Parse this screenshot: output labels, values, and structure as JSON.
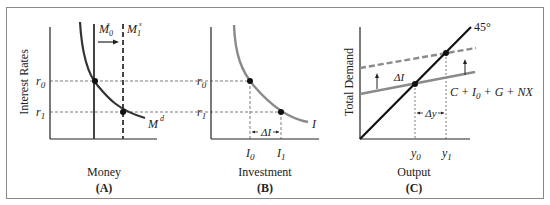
{
  "panels": {
    "a": {
      "ylabel": "Interest Rates",
      "xlabel": "Money",
      "tag": "(A)",
      "ticks": {
        "r0": "r",
        "r0_sub": "0",
        "r1": "r",
        "r1_sub": "1"
      },
      "curves": {
        "ms0": "M",
        "ms0_sub": "0",
        "ms0_sup": "s",
        "ms1": "M",
        "ms1_sub": "1",
        "ms1_sup": "s",
        "md": "M",
        "md_sup": "d"
      }
    },
    "b": {
      "xlabel": "Investment",
      "tag": "(B)",
      "ticks": {
        "r0": "r",
        "r0_sub": "0",
        "r1": "r",
        "r1_sub": "1",
        "i0": "I",
        "i0_sub": "0",
        "i1": "I",
        "i1_sub": "1"
      },
      "curve_label": "I",
      "delta_label": "ΔI"
    },
    "c": {
      "ylabel": "Total Demand",
      "xlabel": "Output",
      "tag": "(C)",
      "ticks": {
        "y0": "y",
        "y0_sub": "0",
        "y1": "y",
        "y1_sub": "1"
      },
      "line45_label": "45°",
      "ad_label": "C + I",
      "ad_label_sub": "0",
      "ad_label_rest": " + G + NX",
      "delta_i": "ΔI",
      "delta_y": "Δy"
    }
  },
  "colors": {
    "dark": "#222222",
    "gray": "#8a8a8a",
    "dashed_gray": "#8a8a8a",
    "border": "#777777"
  }
}
